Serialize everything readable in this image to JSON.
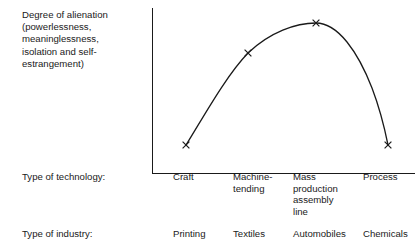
{
  "figure": {
    "y_axis_title_lines": [
      "Degree of alienation",
      "(powerlessness,",
      "meaninglessness,",
      "isolation and self-",
      "estrangement)"
    ],
    "row_labels": {
      "technology": "Type of technology:",
      "industry": "Type of industry:"
    }
  },
  "chart_data": {
    "type": "line",
    "title": "",
    "xlabel": "Type of technology:",
    "ylabel": "Degree of alienation (powerlessness, meaninglessness, isolation and self-estrangement)",
    "categories": [
      "Craft",
      "Machine-tending",
      "Mass production assembly line",
      "Process"
    ],
    "category_labels_wrapped": [
      "Craft",
      "Machine-\ntending",
      "Mass\nproduction\nassembly\nline",
      "Process"
    ],
    "secondary_categories": [
      "Printing",
      "Textiles",
      "Automobiles",
      "Chemicals"
    ],
    "secondary_axis_label": "Type of industry:",
    "values": [
      18,
      74,
      92,
      18
    ],
    "ylim": [
      0,
      100
    ],
    "xlim": [
      0,
      4
    ],
    "grid": false,
    "legend": false,
    "marker": "x",
    "line_color": "#1a1a1a",
    "shape": "inverted-u",
    "points_px": [
      {
        "x": 34,
        "y": 137
      },
      {
        "x": 96,
        "y": 45
      },
      {
        "x": 164,
        "y": 15
      },
      {
        "x": 236,
        "y": 137
      }
    ],
    "annotations": []
  }
}
